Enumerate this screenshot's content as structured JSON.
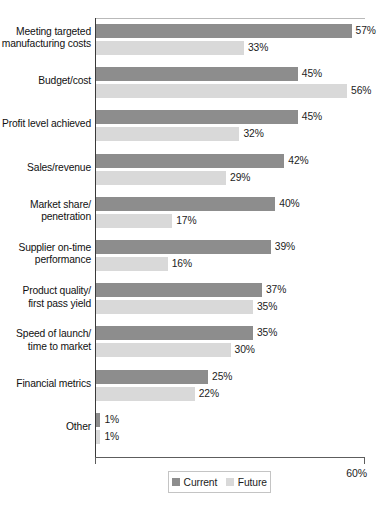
{
  "chart_data": {
    "type": "bar",
    "orientation": "horizontal",
    "title": "",
    "subtitle": "",
    "xlabel": "",
    "ylabel": "",
    "xlim": [
      0,
      60
    ],
    "x_tick_labels": [
      "60%"
    ],
    "value_suffix": "%",
    "grid": false,
    "legend_position": "bottom",
    "categories": [
      "Meeting targeted\nmanufacturing costs",
      "Budget/cost",
      "Profit level achieved",
      "Sales/revenue",
      "Market share/\npenetration",
      "Supplier on-time\nperformance",
      "Product quality/\nfirst pass yield",
      "Speed of launch/\ntime to market",
      "Financial metrics",
      "Other"
    ],
    "series": [
      {
        "name": "Current",
        "color": "#8d8d8d",
        "values": [
          57,
          45,
          45,
          42,
          40,
          39,
          37,
          35,
          25,
          1
        ],
        "labels": [
          "57%",
          "45%",
          "45%",
          "42%",
          "40%",
          "39%",
          "37%",
          "35%",
          "25%",
          "1%"
        ]
      },
      {
        "name": "Future",
        "color": "#d9d9d9",
        "values": [
          33,
          56,
          32,
          29,
          17,
          16,
          35,
          30,
          22,
          1
        ],
        "labels": [
          "33%",
          "56%",
          "32%",
          "29%",
          "17%",
          "16%",
          "35%",
          "30%",
          "22%",
          "1%"
        ]
      }
    ]
  },
  "axis": {
    "max_label": "60%"
  },
  "legend": {
    "items": [
      {
        "label": "Current",
        "swatch": "current"
      },
      {
        "label": "Future",
        "swatch": "future"
      }
    ]
  }
}
